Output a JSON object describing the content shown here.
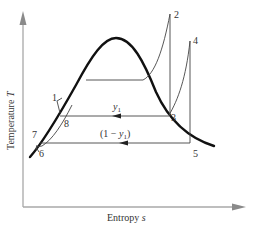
{
  "diagram": {
    "type": "T-s diagram",
    "axes": {
      "y_label": "Temperature",
      "y_symbol": "T",
      "x_label": "Entropy",
      "x_symbol": "s"
    },
    "state_points": [
      {
        "id": "1",
        "label": "1"
      },
      {
        "id": "2",
        "label": "2"
      },
      {
        "id": "3",
        "label": "3"
      },
      {
        "id": "4",
        "label": "4"
      },
      {
        "id": "5",
        "label": "5"
      },
      {
        "id": "6",
        "label": "6"
      },
      {
        "id": "7",
        "label": "7"
      },
      {
        "id": "8",
        "label": "8"
      }
    ],
    "flow_labels": {
      "upper": "y",
      "upper_sub": "1",
      "lower_prefix": "(1 − ",
      "lower_var": "y",
      "lower_sub": "1",
      "lower_suffix": ")"
    },
    "colors": {
      "dome": "#111111",
      "process_lines": "#444444",
      "axes": "#999999",
      "text": "#333333"
    }
  }
}
